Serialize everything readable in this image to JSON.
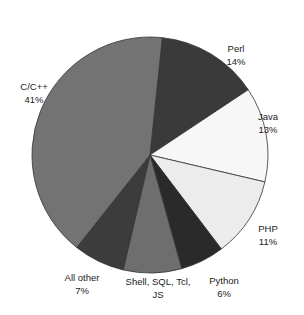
{
  "chart_data": {
    "type": "pie",
    "title": "",
    "start_note": "slices clockwise from near top",
    "slices": [
      {
        "label": "Perl",
        "value": 14,
        "display": "14%",
        "color": "#3a3a3a"
      },
      {
        "label": "Java",
        "value": 13,
        "display": "13%",
        "color": "#f7f7f7"
      },
      {
        "label": "PHP",
        "value": 11,
        "display": "11%",
        "color": "#ececec"
      },
      {
        "label": "Python",
        "value": 6,
        "display": "6%",
        "color": "#2a2a2a"
      },
      {
        "label": "Shell, SQL, Tcl, JS",
        "value": 8,
        "display": "",
        "color": "#6e6e6e"
      },
      {
        "label": "All other",
        "value": 7,
        "display": "7%",
        "color": "#3c3c3c"
      },
      {
        "label": "C/C++",
        "value": 41,
        "display": "41%",
        "color": "#737373"
      }
    ]
  }
}
